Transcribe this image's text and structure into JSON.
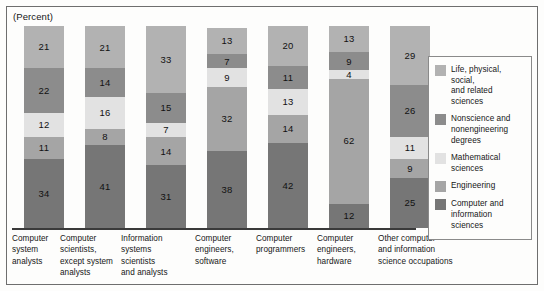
{
  "figure": {
    "axis_unit_label": "(Percent)"
  },
  "chart_data": {
    "type": "bar",
    "title": "",
    "subtitle": "",
    "xlabel": "",
    "ylabel": "(Percent)",
    "ylim": [
      0,
      100
    ],
    "grid": false,
    "stacked": true,
    "orientation": "vertical",
    "legend_position": "right",
    "categories": [
      "Computer system analysts",
      "Computer scientists, except system analysts",
      "Information systems scientists and analysts",
      "Computer engineers, software",
      "Computer programmers",
      "Computer engineers, hardware",
      "Other computer and information science occupations"
    ],
    "category_label_lines": [
      [
        "Computer",
        "system",
        "analysts"
      ],
      [
        "Computer scientists,",
        "except system",
        "analysts"
      ],
      [
        "Information systems",
        "scientists",
        "and analysts"
      ],
      [
        "Computer",
        "engineers,",
        "software"
      ],
      [
        "Computer",
        "programmers"
      ],
      [
        "Computer",
        "engineers,",
        "hardware"
      ],
      [
        "Other computer",
        "and information",
        "science occupations"
      ]
    ],
    "series": [
      {
        "name": "Life, physical, social, and related sciences",
        "color": "#b2b2b2",
        "values": [
          21,
          21,
          33,
          13,
          20,
          13,
          29
        ]
      },
      {
        "name": "Nonscience and nonengineering degrees",
        "color": "#8c8c8c",
        "values": [
          22,
          14,
          15,
          7,
          11,
          9,
          26
        ]
      },
      {
        "name": "Mathematical sciences",
        "color": "#e2e2e2",
        "values": [
          12,
          16,
          7,
          9,
          13,
          4,
          11
        ]
      },
      {
        "name": "Engineering",
        "color": "#a5a5a5",
        "values": [
          11,
          8,
          14,
          32,
          14,
          62,
          9
        ]
      },
      {
        "name": "Computer and information sciences",
        "color": "#767676",
        "values": [
          34,
          41,
          31,
          38,
          42,
          12,
          25
        ]
      }
    ],
    "stack_order_top_to_bottom": [
      "Life, physical, social, and related sciences",
      "Nonscience and nonengineering degrees",
      "Mathematical sciences",
      "Engineering",
      "Computer and information sciences"
    ]
  },
  "legend": {
    "items": [
      {
        "label_lines": [
          "Life, physical, social,",
          "and related sciences"
        ],
        "color": "#b2b2b2"
      },
      {
        "label_lines": [
          "Nonscience and",
          "nonengineering degrees"
        ],
        "color": "#8c8c8c"
      },
      {
        "label_lines": [
          "Mathematical sciences"
        ],
        "color": "#e2e2e2"
      },
      {
        "label_lines": [
          "Engineering"
        ],
        "color": "#a5a5a5"
      },
      {
        "label_lines": [
          "Computer and information",
          "sciences"
        ],
        "color": "#767676"
      }
    ]
  }
}
